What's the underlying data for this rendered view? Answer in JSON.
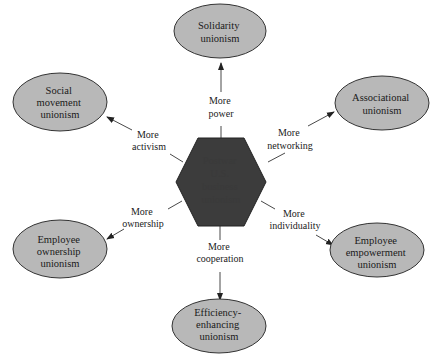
{
  "diagram": {
    "center": {
      "lines": [
        "Postwar",
        "U.S.",
        "business",
        "unionism"
      ],
      "colors": {
        "fill": "#3c3c3c",
        "text": "#3a3a3a"
      }
    },
    "nodes": [
      {
        "id": "solidarity",
        "lines": [
          "Solidarity",
          "unionism"
        ],
        "edge_lines": [
          "More",
          "power"
        ]
      },
      {
        "id": "associational",
        "lines": [
          "Associational",
          "unionism"
        ],
        "edge_lines": [
          "More",
          "networking"
        ]
      },
      {
        "id": "empowerment",
        "lines": [
          "Employee",
          "empowerment",
          "unionism"
        ],
        "edge_lines": [
          "More",
          "individuality"
        ]
      },
      {
        "id": "efficiency",
        "lines": [
          "Efficiency-",
          "enhancing",
          "unionism"
        ],
        "edge_lines": [
          "More",
          "cooperation"
        ]
      },
      {
        "id": "ownership",
        "lines": [
          "Employee",
          "ownership",
          "unionism"
        ],
        "edge_lines": [
          "More",
          "ownership"
        ]
      },
      {
        "id": "social",
        "lines": [
          "Social",
          "movement",
          "unionism"
        ],
        "edge_lines": [
          "More",
          "activism"
        ]
      }
    ],
    "colors": {
      "ellipse_fill": "#b8b8b8",
      "line": "#333333"
    }
  }
}
